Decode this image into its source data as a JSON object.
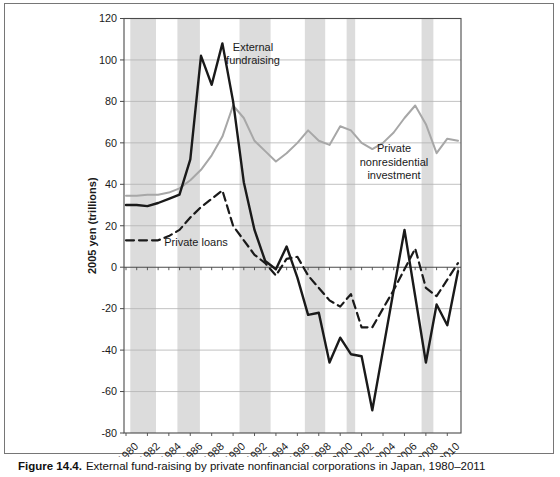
{
  "figure": {
    "caption_label": "Figure 14.4.",
    "caption_text": "External fund-raising by private nonfinancial corporations in Japan, 1980–2011"
  },
  "chart_data": {
    "type": "line",
    "title": "",
    "xlabel": "",
    "ylabel": "2005 yen (trillions)",
    "ylim": [
      -80,
      120
    ],
    "ytick_step": 20,
    "ytick_labels": [
      "120",
      "100",
      "80",
      "60",
      "40",
      "20",
      "0",
      "-20",
      "-40",
      "-60",
      "-80"
    ],
    "x": [
      1980,
      1981,
      1982,
      1983,
      1984,
      1985,
      1986,
      1987,
      1988,
      1989,
      1990,
      1991,
      1992,
      1993,
      1994,
      1995,
      1996,
      1997,
      1998,
      1999,
      2000,
      2001,
      2002,
      2003,
      2004,
      2005,
      2006,
      2007,
      2008,
      2009,
      2010,
      2011
    ],
    "xtick_years": [
      1980,
      1982,
      1984,
      1986,
      1988,
      1990,
      1992,
      1994,
      1996,
      1998,
      2000,
      2002,
      2004,
      2006,
      2008,
      2010
    ],
    "grid": true,
    "legend_position": "inline-annotations",
    "series": [
      {
        "name": "External fundraising",
        "line": "solid",
        "color": "#1a1a1a",
        "width": 2.4,
        "values": [
          30,
          30,
          29.5,
          31,
          33,
          35,
          52,
          102,
          88,
          108,
          80,
          41,
          18,
          3,
          -1,
          10,
          -5,
          -23,
          -22,
          -46,
          -34,
          -42,
          -43,
          -69,
          -40,
          -11,
          18,
          -14,
          -46,
          -18,
          -28,
          -2
        ]
      },
      {
        "name": "Private nonresidential investment",
        "line": "solid",
        "color": "#a7a7a7",
        "width": 2,
        "values": [
          34.5,
          34.5,
          35,
          35,
          36,
          38,
          42,
          47,
          54,
          63,
          78,
          72,
          61,
          56,
          51,
          55,
          60,
          66,
          61,
          59,
          68,
          66,
          60,
          57,
          60,
          65,
          72,
          78,
          69,
          55,
          62,
          61
        ]
      },
      {
        "name": "Private loans",
        "line": "dashed",
        "color": "#1a1a1a",
        "width": 2.2,
        "values": [
          13,
          13,
          13,
          13,
          15,
          18,
          24,
          29,
          33,
          37,
          20,
          13,
          6,
          2,
          -4,
          4,
          5,
          -4,
          -10,
          -16,
          -19,
          -13,
          -29,
          -29,
          -20,
          -11,
          -1,
          9,
          -10,
          -14,
          -6,
          2
        ]
      }
    ],
    "recession_bands": [
      {
        "from": 1980.4,
        "to": 1982.8
      },
      {
        "from": 1984.8,
        "to": 1986.9
      },
      {
        "from": 1990.6,
        "to": 1993.5
      },
      {
        "from": 1996.7,
        "to": 1998.6
      },
      {
        "from": 2000.6,
        "to": 2001.4
      },
      {
        "from": 2007.6,
        "to": 2008.7
      }
    ],
    "annotations": [
      {
        "target": "External fundraising",
        "lines": [
          "External",
          "fundraising"
        ],
        "x": 253,
        "y": 51,
        "line_height": 13
      },
      {
        "target": "Private nonresidential investment",
        "lines": [
          "Private",
          "nonresidential",
          "investment"
        ],
        "x": 394,
        "y": 152,
        "line_height": 13.5
      },
      {
        "target": "Private loans",
        "lines": [
          "Private loans"
        ],
        "x": 196,
        "y": 246,
        "line_height": 13
      }
    ],
    "colors": {
      "band": "#dcdcdc",
      "grid": "#b3b3b3",
      "axis": "#4a4a4a",
      "frame": "#767676"
    }
  }
}
